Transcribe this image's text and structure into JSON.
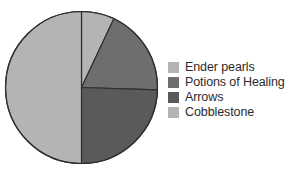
{
  "chart_data": {
    "type": "pie",
    "title": "",
    "subtitle": "",
    "xlabel": "",
    "ylabel": "",
    "grid": false,
    "legend_position": "right",
    "start_angle_deg": 0,
    "direction": "clockwise",
    "center": {
      "cx": 81.5,
      "cy": 87.5,
      "r": 76
    },
    "categories": [
      "Ender pearls",
      "Potions of Healing",
      "Arrows",
      "Cobblestone"
    ],
    "values": [
      7,
      18.5,
      24.5,
      50
    ],
    "value_unit": "%",
    "colors": [
      "#b4b4b4",
      "#6e6e6e",
      "#5a5a5a",
      "#b4b4b4"
    ],
    "slices": [
      {
        "label": "Ender pearls",
        "value": 7,
        "color": "#b4b4b4",
        "start_angle_deg": 0,
        "end_angle_deg": 25.2
      },
      {
        "label": "Potions of Healing",
        "value": 18.5,
        "color": "#6e6e6e",
        "start_angle_deg": 25.2,
        "end_angle_deg": 91.8
      },
      {
        "label": "Arrows",
        "value": 24.5,
        "color": "#5a5a5a",
        "start_angle_deg": 91.8,
        "end_angle_deg": 180
      },
      {
        "label": "Cobblestone",
        "value": 50,
        "color": "#b4b4b4",
        "start_angle_deg": 180,
        "end_angle_deg": 360
      }
    ],
    "outline_color": "#2f2f2f",
    "outline_width": 1.2,
    "background": "#ffffff"
  },
  "legend": {
    "items": [
      {
        "label": "Ender pearls",
        "color": "#b4b4b4",
        "swatch_name": "legend-swatch-ender-pearls"
      },
      {
        "label": "Potions of Healing",
        "color": "#6e6e6e",
        "swatch_name": "legend-swatch-potions-of-healing"
      },
      {
        "label": "Arrows",
        "color": "#5a5a5a",
        "swatch_name": "legend-swatch-arrows"
      },
      {
        "label": "Cobblestone",
        "color": "#b4b4b4",
        "swatch_name": "legend-swatch-cobblestone"
      }
    ]
  }
}
